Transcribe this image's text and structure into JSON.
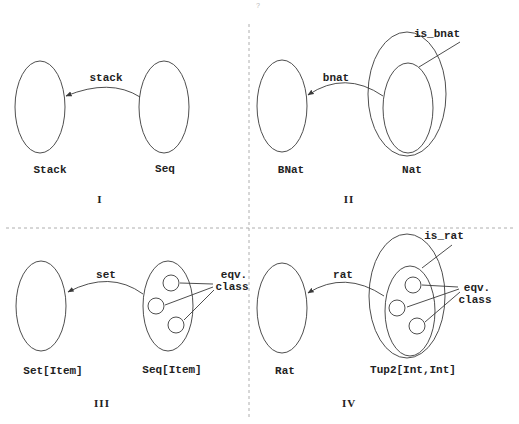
{
  "figure": {
    "page_mark": "?",
    "panels": [
      {
        "id": "I",
        "roman": "I",
        "roman_pos": [
          100,
          203
        ],
        "sets": [
          {
            "name": "Stack",
            "cx": 40,
            "cy": 107,
            "rx": 25,
            "ry": 46,
            "label_pos": [
              50,
              173
            ]
          },
          {
            "name": "Seq",
            "cx": 164,
            "cy": 107,
            "rx": 25,
            "ry": 46,
            "label_pos": [
              165,
              172
            ]
          }
        ],
        "arrow": {
          "label": "stack",
          "label_pos": [
            106,
            81
          ],
          "path": "M140,97 Q110,78 66,96"
        }
      },
      {
        "id": "II",
        "roman": "II",
        "roman_pos": [
          349,
          203
        ],
        "sets": [
          {
            "name": "BNat",
            "cx": 282,
            "cy": 106,
            "rx": 25,
            "ry": 46,
            "label_pos": [
              291,
              173
            ]
          },
          {
            "name": "Nat",
            "cx": 407,
            "cy": 94,
            "rx": 39,
            "ry": 62,
            "label_pos": [
              412,
              173
            ]
          }
        ],
        "subsets": [
          {
            "name": "is_bnat",
            "cx": 408,
            "cy": 108,
            "rx": 25,
            "ry": 45
          }
        ],
        "callouts": [
          {
            "label": "is_bnat",
            "label_pos": [
              437,
              37
            ],
            "line": "M460,42 L419,67"
          }
        ],
        "arrow": {
          "label": "bnat",
          "label_pos": [
            336,
            81
          ],
          "path": "M383,96 Q345,70 308,95"
        }
      },
      {
        "id": "III",
        "roman": "III",
        "roman_pos": [
          102,
          407
        ],
        "sets": [
          {
            "name": "Set[Item]",
            "cx": 41,
            "cy": 306,
            "rx": 25,
            "ry": 45,
            "label_pos": [
              53,
              374
            ]
          },
          {
            "name": "Seq[Item]",
            "cx": 168,
            "cy": 306,
            "rx": 25,
            "ry": 45,
            "label_pos": [
              172,
              373
            ]
          }
        ],
        "eqv_circles": [
          {
            "cx": 171,
            "cy": 283,
            "r": 8
          },
          {
            "cx": 156,
            "cy": 306,
            "r": 8
          },
          {
            "cx": 176,
            "cy": 325,
            "r": 8
          }
        ],
        "callouts": [
          {
            "label": "eqv.",
            "label_pos": [
              234,
              278
            ]
          },
          {
            "label": "class",
            "label_pos": [
              232,
              290
            ]
          }
        ],
        "callout_lines": [
          "M180,283 L213,284",
          "M165,305 L213,287",
          "M184,320 L214,290"
        ],
        "arrow": {
          "label": "set",
          "label_pos": [
            106,
            278
          ],
          "path": "M143,294 Q110,270 68,292"
        }
      },
      {
        "id": "IV",
        "roman": "IV",
        "roman_pos": [
          349,
          407
        ],
        "sets": [
          {
            "name": "Rat",
            "cx": 282,
            "cy": 308,
            "rx": 25,
            "ry": 45,
            "label_pos": [
              285,
              374
            ]
          },
          {
            "name": "Tup2[Int,Int]",
            "cx": 407,
            "cy": 296,
            "rx": 38,
            "ry": 62,
            "label_pos": [
              413,
              373
            ]
          }
        ],
        "subsets": [
          {
            "name": "is_rat",
            "cx": 410,
            "cy": 311,
            "rx": 25,
            "ry": 45
          }
        ],
        "eqv_circles": [
          {
            "cx": 413,
            "cy": 285,
            "r": 8
          },
          {
            "cx": 397,
            "cy": 308,
            "r": 8
          },
          {
            "cx": 417,
            "cy": 326,
            "r": 8
          }
        ],
        "callouts": [
          {
            "label": "is_rat",
            "label_pos": [
              444,
              239
            ]
          },
          {
            "label": "eqv.",
            "label_pos": [
              477,
              291
            ]
          },
          {
            "label": "class",
            "label_pos": [
              475,
              303
            ]
          }
        ],
        "callout_lines": [
          "M452,245 L422,268",
          "M422,285 L458,287",
          "M407,307 L459,289",
          "M425,322 L460,292"
        ],
        "arrow": {
          "label": "rat",
          "label_pos": [
            343,
            278
          ],
          "path": "M384,296 Q345,270 308,293"
        }
      }
    ],
    "dividers": {
      "horizontal": {
        "x1": 6,
        "y1": 228,
        "x2": 513,
        "y2": 228
      },
      "vertical": {
        "x1": 249,
        "y1": 24,
        "x2": 249,
        "y2": 420
      }
    }
  }
}
